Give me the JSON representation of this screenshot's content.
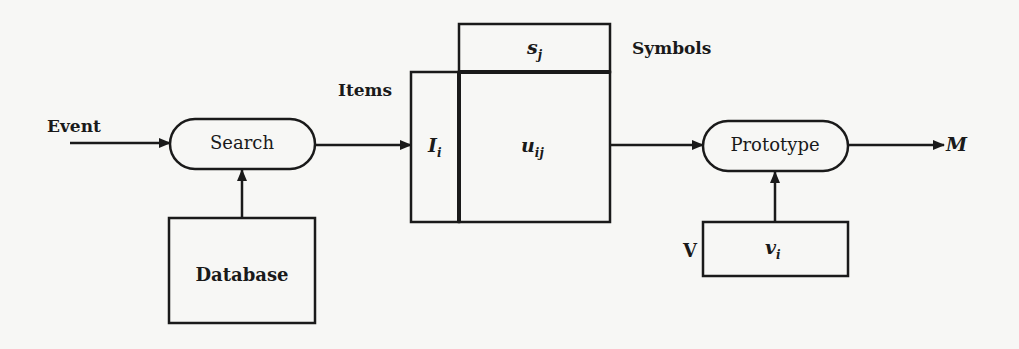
{
  "diagram": {
    "title": "",
    "nodes": {
      "event": {
        "label": "Event"
      },
      "search": {
        "label": "Search",
        "shape": "rounded-pill"
      },
      "database": {
        "label": "Database",
        "shape": "rectangle"
      },
      "items": {
        "label": "Items",
        "cell_symbol": "I",
        "cell_subscript": "i"
      },
      "symbols": {
        "label": "Symbols",
        "cell_symbol": "s",
        "cell_subscript": "j"
      },
      "matrix": {
        "cell_symbol": "u",
        "cell_subscript": "ij"
      },
      "prototype": {
        "label": "Prototype",
        "shape": "rounded-pill"
      },
      "v_box": {
        "label": "V",
        "cell_symbol": "v",
        "cell_subscript": "i"
      },
      "output": {
        "label": "M"
      }
    },
    "edges": [
      {
        "from": "event",
        "to": "search"
      },
      {
        "from": "database",
        "to": "search"
      },
      {
        "from": "search",
        "to": "items"
      },
      {
        "from": "matrix",
        "to": "prototype"
      },
      {
        "from": "v_box",
        "to": "prototype"
      },
      {
        "from": "prototype",
        "to": "output"
      }
    ],
    "colors": {
      "stroke": "#1a1a1a",
      "background": "#f7f7f5"
    }
  }
}
